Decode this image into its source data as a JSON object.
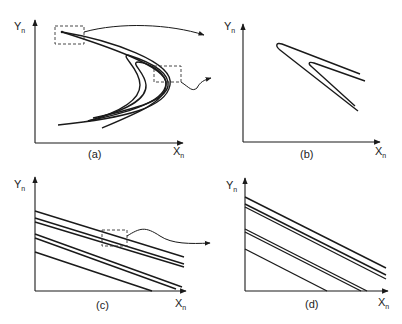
{
  "figure": {
    "panels": [
      {
        "id": "a",
        "caption": "(a)",
        "y_label": "Y",
        "y_sub": "n",
        "x_label": "X",
        "x_sub": "n",
        "description": "Horseshoe-shaped folded attractor with two zoom boxes"
      },
      {
        "id": "b",
        "caption": "(b)",
        "y_label": "Y",
        "y_sub": "n",
        "x_label": "X",
        "x_sub": "n",
        "description": "Magnified tip of fold showing two nested strands"
      },
      {
        "id": "c",
        "caption": "(c)",
        "y_label": "Y",
        "y_sub": "n",
        "x_label": "X",
        "x_sub": "n",
        "description": "Magnified region showing parallel line bands with zoom box"
      },
      {
        "id": "d",
        "caption": "(d)",
        "y_label": "Y",
        "y_sub": "n",
        "x_label": "X",
        "x_sub": "n",
        "description": "Further magnification revealing self-similar parallel line structure"
      }
    ]
  },
  "colors": {
    "line": "#1a1a1a",
    "background": "#ffffff"
  }
}
